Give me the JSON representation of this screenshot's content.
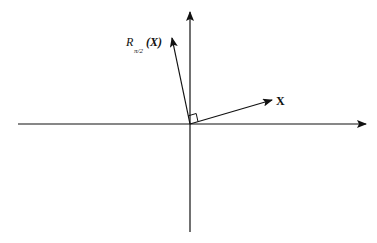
{
  "diagram": {
    "title": "",
    "type": "vector rotation on coordinate axes",
    "colors": {
      "ink": "#111111",
      "background": "#ffffff"
    },
    "vectors": {
      "x": {
        "label": "X",
        "direction_deg": 16
      },
      "rotated": {
        "label_prefix": "R",
        "label_subscript": "π/2",
        "label_argument": "(X)",
        "direction_deg": 106
      }
    },
    "right_angle_marker": true
  }
}
